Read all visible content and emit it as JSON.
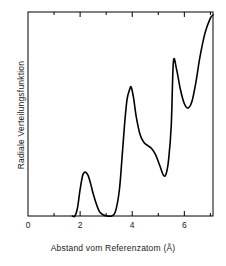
{
  "chart_data": {
    "type": "line",
    "title": "",
    "xlabel": "Abstand vom Referenzatom (Å)",
    "ylabel": "Radiale Verteilungsfunktion",
    "xlim": [
      0,
      7.1
    ],
    "ylim": [
      0,
      1.0
    ],
    "grid": false,
    "legend": null,
    "xticks_major": [
      0,
      2,
      4,
      6
    ],
    "xticks_major_labels": [
      "0",
      "2",
      "4",
      "6"
    ],
    "xticks_minor": [
      1,
      3,
      5,
      7
    ],
    "yticks": [],
    "ytick_labels": [],
    "series": [
      {
        "name": "Radiale Verteilungsfunktion",
        "color": "#000000",
        "x": [
          1.7,
          1.8,
          1.9,
          2.0,
          2.1,
          2.2,
          2.3,
          2.4,
          2.5,
          2.62,
          2.75,
          2.9,
          3.05,
          3.2,
          3.35,
          3.5,
          3.6,
          3.7,
          3.8,
          3.9,
          3.96,
          4.05,
          4.15,
          4.3,
          4.45,
          4.6,
          4.75,
          4.9,
          5.05,
          5.2,
          5.3,
          5.4,
          5.5,
          5.58,
          5.7,
          5.85,
          6.0,
          6.15,
          6.3,
          6.45,
          6.6,
          6.8,
          7.0,
          7.1
        ],
        "y": [
          0.0,
          0.0,
          0.04,
          0.13,
          0.2,
          0.215,
          0.2,
          0.16,
          0.11,
          0.06,
          0.02,
          0.005,
          0.0,
          0.0,
          0.02,
          0.12,
          0.27,
          0.44,
          0.57,
          0.62,
          0.632,
          0.58,
          0.49,
          0.4,
          0.36,
          0.345,
          0.33,
          0.3,
          0.25,
          0.2,
          0.206,
          0.28,
          0.45,
          0.755,
          0.72,
          0.62,
          0.55,
          0.53,
          0.565,
          0.66,
          0.78,
          0.9,
          0.97,
          0.985
        ]
      }
    ],
    "annotations": {
      "peaks": [
        {
          "x": 2.2,
          "y": 0.215,
          "label": "first peak"
        },
        {
          "x": 3.96,
          "y": 0.632,
          "label": "second peak"
        },
        {
          "x": 5.58,
          "y": 0.755,
          "label": "third peak"
        }
      ],
      "minima": [
        {
          "x": 3.1,
          "y": 0.0,
          "label": "baseline between first and second peak"
        },
        {
          "x": 5.0,
          "y": 0.2,
          "label": "valley before third peak"
        },
        {
          "x": 6.2,
          "y": 0.53,
          "label": "valley after third peak"
        }
      ],
      "shoulder": {
        "x": 4.55,
        "y": 0.35,
        "label": "shoulder on second peak"
      }
    }
  }
}
